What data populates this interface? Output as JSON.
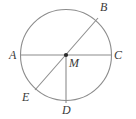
{
  "figure": {
    "kind": "circle-geometry-diagram",
    "background_color": "#ffffff",
    "stroke_color": "#8c8c8c",
    "label_color": "#3a3a3a",
    "circle": {
      "center_label": "M",
      "center_x": 66,
      "center_y": 55,
      "radius": 46
    },
    "points": [
      {
        "name": "A",
        "label": "A",
        "x": 9,
        "y": 49
      },
      {
        "name": "B",
        "label": "B",
        "x": 100,
        "y": 1
      },
      {
        "name": "C",
        "label": "C",
        "x": 114,
        "y": 49
      },
      {
        "name": "D",
        "label": "D",
        "x": 62,
        "y": 104
      },
      {
        "name": "E",
        "label": "E",
        "x": 22,
        "y": 91
      },
      {
        "name": "M",
        "label": "M",
        "x": 69,
        "y": 57
      }
    ],
    "segments": [
      {
        "name": "diameter-AC",
        "label": "AC",
        "x1": 20,
        "y1": 55,
        "x2": 112,
        "y2": 55
      },
      {
        "name": "diameter-BE",
        "label": "BE",
        "x1": 98,
        "y1": 18,
        "x2": 35,
        "y2": 90
      },
      {
        "name": "radius-MD",
        "label": "MD",
        "x1": 66,
        "y1": 55,
        "x2": 66,
        "y2": 103
      }
    ]
  }
}
